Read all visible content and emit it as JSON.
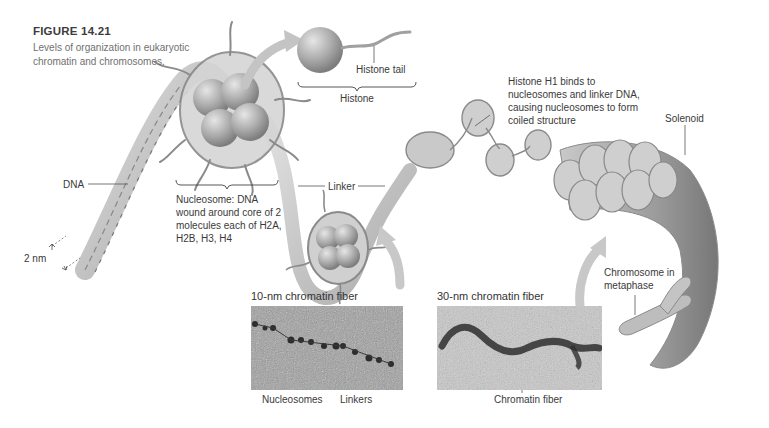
{
  "figure": {
    "number": "FIGURE 14.21",
    "caption": "Levels of organization in eukaryotic chromatin and chromosomes."
  },
  "labels": {
    "dna": "DNA",
    "dna_width": "2 nm",
    "histone_tail": "Histone tail",
    "histone": "Histone",
    "nucleosome": "Nucleosome: DNA wound around core of 2 molecules each of H2A, H2B, H3, H4",
    "linker": "Linker",
    "histone_h1": "Histone H1 binds to nucleosomes and linker DNA, causing nucleosomes to form coiled structure",
    "solenoid": "Solenoid",
    "chromosome": "Chromosome in metaphase"
  },
  "panels": [
    {
      "title": "10-nm chromatin fiber",
      "annotations": [
        "Nucleosomes",
        "Linkers"
      ]
    },
    {
      "title": "30-nm chromatin fiber",
      "annotations": [
        "Chromatin fiber"
      ]
    }
  ],
  "colors": {
    "background": "#ffffff",
    "structure_gray": "#9a9a9a",
    "arrow_gray": "#c4c4c4",
    "text": "#3a3a3a",
    "caption_text": "#707070"
  }
}
